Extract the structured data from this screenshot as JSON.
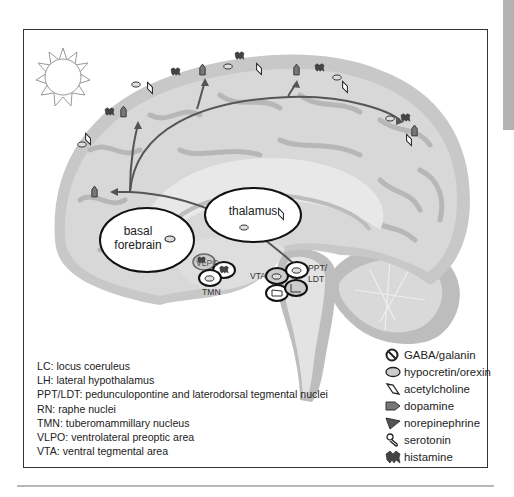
{
  "figure": {
    "regions": {
      "thalamus": "thalamus",
      "basal_forebrain_line1": "basal",
      "basal_forebrain_line2": "forebrain",
      "vlpo": "VLPO",
      "tmn": "TMN",
      "vta": "VTA",
      "ppt_ldt_line1": "PPT/",
      "ppt_ldt_line2": "LDT"
    },
    "sun_icon": "sun-icon",
    "colors": {
      "cortex_light": "#d4d4d4",
      "cortex_dark": "#a9a9a9",
      "inner_light": "#e6e6e6",
      "arrow": "#555555",
      "frame": "#333333",
      "side_bar": "#b3b3b3"
    }
  },
  "abbreviations": [
    "LC: locus coeruleus",
    "LH: lateral hypothalamus",
    "PPT/LDT: pedunculopontine and laterodorsal tegmental nuclei",
    "RN: raphe nuclei",
    "TMN: tuberomammillary nucleus",
    "VLPO: ventrolateral preoptic area",
    "VTA: ventral tegmental area"
  ],
  "legend": [
    {
      "icon": "gaba-galanin-icon",
      "label": "GABA/galanin"
    },
    {
      "icon": "hypocretin-orexin-icon",
      "label": "hypocretin/orexin"
    },
    {
      "icon": "acetylcholine-icon",
      "label": "acetylcholine"
    },
    {
      "icon": "dopamine-icon",
      "label": "dopamine"
    },
    {
      "icon": "norepinephrine-icon",
      "label": "norepinephrine"
    },
    {
      "icon": "serotonin-icon",
      "label": "serotonin"
    },
    {
      "icon": "histamine-icon",
      "label": "histamine"
    }
  ]
}
